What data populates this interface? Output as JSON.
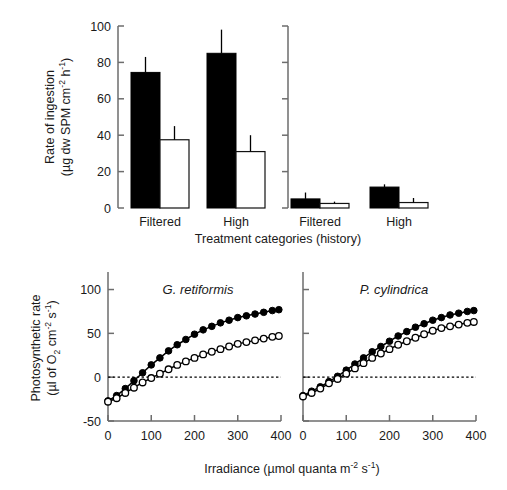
{
  "figure": {
    "background": "#ffffff",
    "ink": "#000000",
    "axis_color": "#6d6d6d"
  },
  "chart_data": [
    {
      "id": "ingestion-bar-chart",
      "type": "bar",
      "title": "",
      "xlabel": "Treatment categories  (history)",
      "ylabel_line1": "Rate of ingestion",
      "ylabel_line2": "(µg dw SPM cm⁻² h⁻¹)",
      "ylabel_plain": "Rate of ingestion (µg dw SPM cm⁻² h⁻¹)",
      "ylim": [
        0,
        100
      ],
      "yticks": [
        0,
        20,
        40,
        60,
        80,
        100
      ],
      "ytick_labels": [
        "0",
        "20",
        "40",
        "60",
        "80",
        "100"
      ],
      "grid": false,
      "legend": "none",
      "second_axis": {
        "present": true,
        "labeled": false,
        "ticks": [
          0,
          20,
          40,
          60,
          80,
          100
        ],
        "note": "unlabeled duplicate scale separating the two group pairs"
      },
      "categories": [
        "Filtered",
        "High",
        "Filtered",
        "High"
      ],
      "group_labels": [
        "Filtered",
        "High"
      ],
      "series": [
        {
          "name": "black-bar",
          "fill": "#000000",
          "values": [
            74.5,
            85.0,
            5.0,
            11.5
          ],
          "errors": [
            8.5,
            13.0,
            3.5,
            1.5
          ]
        },
        {
          "name": "white-bar",
          "fill": "#ffffff",
          "values": [
            37.5,
            31.0,
            2.5,
            3.0
          ],
          "errors": [
            7.5,
            9.0,
            1.0,
            2.5
          ]
        }
      ]
    },
    {
      "id": "photosynthesis-g-retiformis",
      "type": "line",
      "title": "G. retiformis",
      "xlabel": "Irradiance (µmol quanta m⁻² s⁻¹)",
      "ylabel_line1": "Photosynthetic rate",
      "ylabel_line2": "(µl of O₂ cm⁻² s⁻¹)",
      "ylabel_plain": "Photosynthetic rate (µl of O₂ cm⁻² s⁻¹)",
      "xlim": [
        0,
        400
      ],
      "ylim": [
        -50,
        120
      ],
      "xticks": [
        0,
        100,
        200,
        300,
        400
      ],
      "xtick_labels": [
        "0",
        "100",
        "200",
        "300",
        "400"
      ],
      "yticks": [
        -50,
        0,
        50,
        100
      ],
      "ytick_labels": [
        "-50",
        "0",
        "50",
        "100"
      ],
      "grid": false,
      "zero_reference_line": 0,
      "legend": "none",
      "x": [
        0,
        20,
        40,
        60,
        80,
        100,
        120,
        140,
        160,
        180,
        200,
        220,
        240,
        260,
        280,
        300,
        320,
        340,
        360,
        380,
        395
      ],
      "series": [
        {
          "name": "filled-circles",
          "marker": "filled-circle",
          "values": [
            -27,
            -21,
            -13,
            -4,
            5,
            14,
            22,
            30,
            37,
            43,
            49,
            54,
            58,
            62,
            65,
            68,
            70,
            72,
            74,
            76,
            77
          ]
        },
        {
          "name": "open-circles",
          "marker": "open-circle",
          "values": [
            -28,
            -24,
            -18,
            -12,
            -6,
            -1,
            4,
            9,
            14,
            18,
            22,
            26,
            29,
            32,
            35,
            38,
            40,
            42,
            44,
            46,
            47
          ]
        }
      ]
    },
    {
      "id": "photosynthesis-p-cylindrica",
      "type": "line",
      "title": "P. cylindrica",
      "xlabel": "Irradiance (µmol quanta m⁻² s⁻¹)",
      "ylabel_plain": "Photosynthetic rate (µl of O₂ cm⁻² s⁻¹)",
      "xlim": [
        0,
        400
      ],
      "ylim": [
        -50,
        120
      ],
      "xticks": [
        0,
        100,
        200,
        300,
        400
      ],
      "xtick_labels": [
        "0",
        "100",
        "200",
        "300",
        "400"
      ],
      "yticks": [
        -50,
        0,
        50,
        100
      ],
      "ytick_labels": [],
      "grid": false,
      "zero_reference_line": 0,
      "legend": "none",
      "x": [
        0,
        20,
        40,
        60,
        80,
        100,
        120,
        140,
        160,
        180,
        200,
        220,
        240,
        260,
        280,
        300,
        320,
        340,
        360,
        380,
        395
      ],
      "series": [
        {
          "name": "filled-circles",
          "marker": "filled-circle",
          "values": [
            -21,
            -16,
            -11,
            -5,
            1,
            8,
            15,
            22,
            29,
            35,
            41,
            47,
            52,
            57,
            61,
            65,
            68,
            71,
            73,
            75,
            76
          ]
        },
        {
          "name": "open-circles",
          "marker": "open-circle",
          "values": [
            -22,
            -18,
            -13,
            -7,
            -2,
            4,
            10,
            16,
            22,
            27,
            32,
            37,
            41,
            45,
            49,
            53,
            56,
            58,
            60,
            62,
            63
          ]
        }
      ]
    }
  ]
}
